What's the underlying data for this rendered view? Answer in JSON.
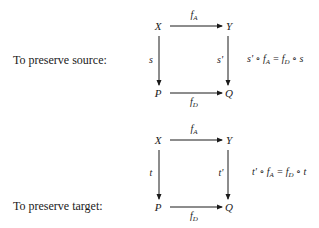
{
  "diagrams": [
    {
      "caption": "To preserve source:",
      "nodes": {
        "tl": "X",
        "tr": "Y",
        "bl": "P",
        "br": "Q"
      },
      "arrows": {
        "top": {
          "f": "f",
          "sub": "A"
        },
        "left": "s",
        "right": "s'",
        "bottom": {
          "f": "f",
          "sub": "D"
        }
      },
      "equation": {
        "lhs": "s' ∘ f",
        "lhs_sub": "A",
        "eq": " = f",
        "rhs_sub": "D",
        "rhs": " ∘ s"
      }
    },
    {
      "caption": "To preserve target:",
      "nodes": {
        "tl": "X",
        "tr": "Y",
        "bl": "P",
        "br": "Q"
      },
      "arrows": {
        "top": {
          "f": "f",
          "sub": "A"
        },
        "left": "t",
        "right": "t'",
        "bottom": {
          "f": "f",
          "sub": "D"
        }
      },
      "equation": {
        "lhs": "t' ∘ f",
        "lhs_sub": "A",
        "eq": " = f",
        "rhs_sub": "D",
        "rhs": " ∘ t"
      }
    }
  ]
}
